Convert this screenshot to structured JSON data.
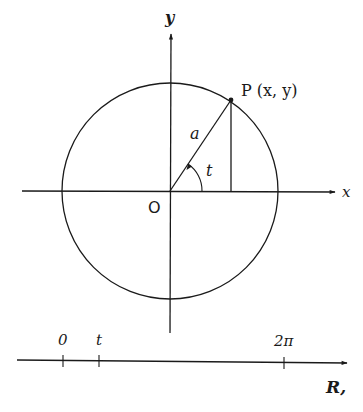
{
  "diagram": {
    "type": "unit-circle-parametrization",
    "colors": {
      "ink": "#1a1a1a",
      "background": "#ffffff"
    },
    "axes": {
      "x_label": "x",
      "y_label": "y",
      "origin_label": "O"
    },
    "circle": {
      "center": [
        170,
        191
      ],
      "radius": 108,
      "radius_label": "a"
    },
    "point": {
      "label": "P (x, y)",
      "position": [
        231,
        100
      ]
    },
    "angle": {
      "label": "t",
      "arc_radius": 32
    },
    "number_line": {
      "label": "R,",
      "ticks": [
        {
          "label": "0",
          "x": 63
        },
        {
          "label": "t",
          "x": 99
        },
        {
          "label": "2π",
          "x": 284
        }
      ]
    }
  }
}
